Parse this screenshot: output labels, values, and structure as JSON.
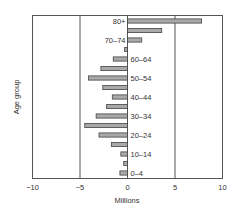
{
  "chart_data": {
    "type": "bar",
    "orientation": "horizontal",
    "title": "",
    "xlabel": "Millions",
    "ylabel": "Age group",
    "xlim": [
      -10,
      10
    ],
    "x_ticks": [
      "-10",
      "-5",
      "0",
      "5",
      "10"
    ],
    "grid": "vertical lines at -5, 0, 5",
    "legend": null,
    "categories": [
      "80+",
      "75-79",
      "70-74",
      "65-69",
      "60-64",
      "55-59",
      "50-54",
      "45-49",
      "40-44",
      "35-39",
      "30-34",
      "25-29",
      "20-24",
      "15-19",
      "10-14",
      "5-9",
      "0-4"
    ],
    "category_labels_shown": [
      "80+",
      "",
      "70–74",
      "",
      "60–64",
      "",
      "50–54",
      "",
      "40–44",
      "",
      "30–34",
      "",
      "20–24",
      "",
      "10–14",
      "",
      "0–4"
    ],
    "values": [
      7.8,
      3.6,
      1.5,
      -0.3,
      -1.5,
      -2.8,
      -4.1,
      -2.6,
      -1.6,
      -2.2,
      -3.3,
      -4.5,
      -3.0,
      -1.7,
      -0.7,
      -0.4,
      -0.8
    ],
    "bar_color": "#a9a9a9"
  }
}
